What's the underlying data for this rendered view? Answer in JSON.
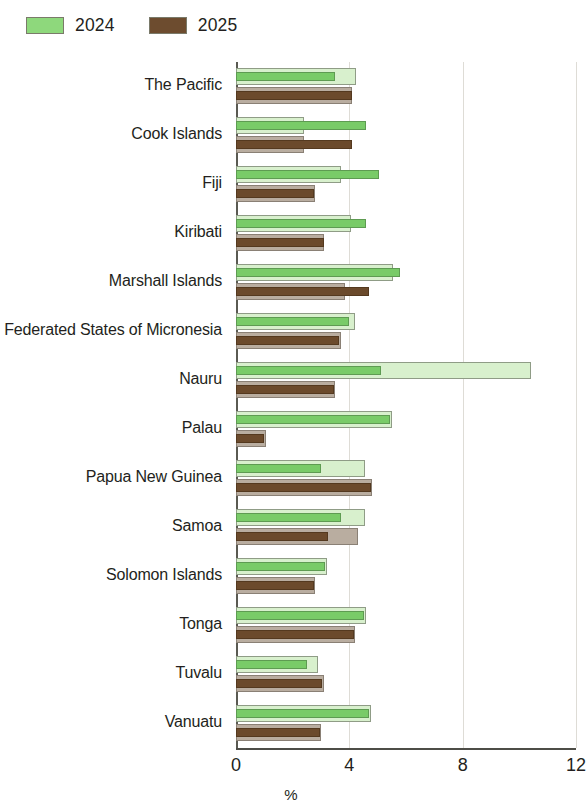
{
  "legend": {
    "entries": [
      {
        "label": "2024",
        "color": "#8ed87c",
        "key": "2024"
      },
      {
        "label": "2025",
        "color": "#6d4c2f",
        "key": "2025"
      }
    ]
  },
  "axis": {
    "x_ticks": [
      "0",
      "4",
      "8",
      "12"
    ],
    "x_title": "%"
  },
  "chart_data": {
    "type": "bar",
    "orientation": "horizontal",
    "title": "",
    "subtitle": "",
    "xlabel": "%",
    "ylabel": "",
    "xlim": [
      0,
      12
    ],
    "xticks": [
      0,
      4,
      8,
      12
    ],
    "grid": "vertical",
    "legend_position": "top-left",
    "note": "Each economy shows two bars per year: a lighter outer band and a darker saturated inner band (projection vs. revised estimate).",
    "categories": [
      "The Pacific",
      "Cook Islands",
      "Fiji",
      "Kiribati",
      "Marshall Islands",
      "Federated States of Micronesia",
      "Nauru",
      "Palau",
      "Papua New Guinea",
      "Samoa",
      "Solomon Islands",
      "Tonga",
      "Tuvalu",
      "Vanuatu"
    ],
    "series": [
      {
        "name": "2024",
        "variant": "outer",
        "color": "#d8f0cd",
        "values": [
          4.25,
          2.4,
          3.7,
          4.05,
          5.55,
          4.2,
          10.4,
          5.5,
          4.55,
          4.55,
          3.2,
          4.6,
          2.9,
          4.75
        ]
      },
      {
        "name": "2024",
        "variant": "inner",
        "color": "#79cb68",
        "values": [
          3.5,
          4.6,
          5.05,
          4.6,
          5.8,
          4.0,
          5.1,
          5.45,
          3.0,
          3.7,
          3.15,
          4.5,
          2.5,
          4.7
        ]
      },
      {
        "name": "2025",
        "variant": "outer",
        "color": "#b9ada0",
        "values": [
          4.1,
          2.4,
          2.8,
          3.1,
          3.85,
          3.7,
          3.5,
          1.05,
          4.8,
          4.3,
          2.8,
          4.2,
          3.1,
          3.0
        ]
      },
      {
        "name": "2025",
        "variant": "inner",
        "color": "#6b4a2c",
        "values": [
          4.1,
          4.1,
          2.75,
          3.1,
          4.7,
          3.65,
          3.45,
          1.0,
          4.75,
          3.25,
          2.75,
          4.15,
          3.05,
          2.95
        ]
      }
    ]
  }
}
